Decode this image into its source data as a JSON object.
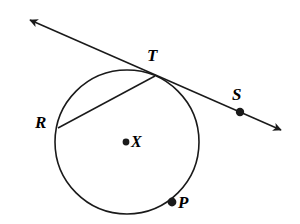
{
  "figure": {
    "kind": "circle-tangent-chord-diagram",
    "background_color": "#ffffff",
    "stroke_color": "#1a1a1a",
    "labels": {
      "tangent_point": "T",
      "chord_endpoint": "R",
      "line_point": "S",
      "center": "X",
      "circle_point": "P"
    },
    "circle": {
      "center_x": 127,
      "center_y": 142,
      "radius": 72,
      "stroke_width": 1.6
    },
    "center_dot": {
      "cx": 126,
      "cy": 142,
      "r": 3.4
    },
    "points": [
      {
        "name": "T",
        "cx": 152,
        "cy": 75,
        "dot": false
      },
      {
        "name": "R",
        "cx": 58,
        "cy": 128,
        "dot": false
      },
      {
        "name": "S",
        "cx": 240,
        "cy": 112,
        "dot": true,
        "r": 4.2
      },
      {
        "name": "P",
        "cx": 172,
        "cy": 202,
        "dot": true,
        "r": 4.4
      },
      {
        "name": "X",
        "cx": 126,
        "cy": 142,
        "dot": true,
        "r": 3.4
      }
    ],
    "tangent_line": {
      "from_x": 30,
      "from_y": 20,
      "to_x": 281,
      "to_y": 130,
      "stroke_width": 1.5,
      "arrow_start": {
        "tip_x": 24,
        "tip_y": 16
      },
      "arrow_end": {
        "tip_x": 287,
        "tip_y": 133
      }
    },
    "chord_line": {
      "from_x": 58,
      "from_y": 128,
      "to_x": 155,
      "to_y": 76,
      "stroke_width": 1.5
    }
  }
}
